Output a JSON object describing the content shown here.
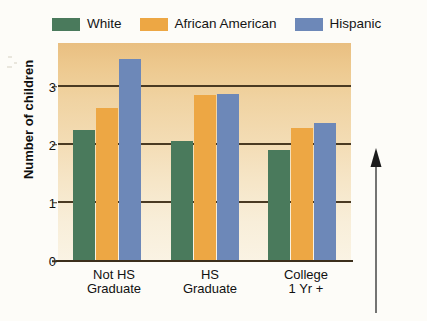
{
  "chart_data": {
    "type": "bar",
    "title": "",
    "subtitle": "",
    "xlabel": "",
    "ylabel": "Number of children",
    "ylim": [
      0,
      3.75
    ],
    "yticks": [
      "0",
      "1",
      "2",
      "3"
    ],
    "ytick_values": [
      0,
      1,
      2,
      3
    ],
    "grid": true,
    "legend_position": "top-left",
    "categories": [
      "Not HS\nGraduate",
      "HS\nGraduate",
      "College\n1 Yr +"
    ],
    "category_lines": [
      [
        "Not HS",
        "Graduate"
      ],
      [
        "HS",
        "Graduate"
      ],
      [
        "College",
        "1 Yr +"
      ]
    ],
    "series": [
      {
        "name": "White",
        "color": "#4a7a5c",
        "values": [
          2.26,
          2.06,
          1.91
        ]
      },
      {
        "name": "African American",
        "color": "#eda744",
        "values": [
          2.64,
          2.86,
          2.28
        ]
      },
      {
        "name": "Hispanic",
        "color": "#6d88b8",
        "values": [
          3.47,
          2.88,
          2.38
        ]
      }
    ],
    "annotations": [
      {
        "name": "upward-arrow",
        "type": "arrow",
        "direction": "up",
        "points_to_value": 2.0
      }
    ]
  },
  "legend": {
    "items": [
      {
        "label": "White",
        "color": "#4a7a5c"
      },
      {
        "label": "African American",
        "color": "#eda744"
      },
      {
        "label": "Hispanic",
        "color": "#6d88b8"
      }
    ]
  },
  "axes": {
    "y_title": "Number of children",
    "y_ticks": [
      "3",
      "2",
      "1",
      "0"
    ],
    "x_groups": [
      {
        "line1": "Not HS",
        "line2": "Graduate"
      },
      {
        "line1": "HS",
        "line2": "Graduate"
      },
      {
        "line1": "College",
        "line2": "1 Yr +"
      }
    ]
  },
  "colors": {
    "white_series": "#4a7a5c",
    "african_american_series": "#eda744",
    "hispanic_series": "#6d88b8",
    "plot_top": "#e9bf81",
    "plot_bottom": "#faf3e4",
    "axis": "#3c2f1c"
  }
}
